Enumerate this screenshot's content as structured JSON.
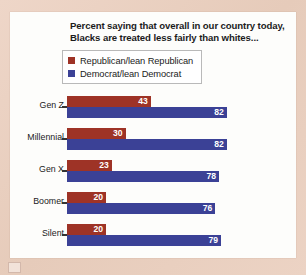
{
  "chart_data": {
    "type": "bar",
    "orientation": "horizontal",
    "title": "Percent saying that overall in our country today, Blacks are treated less fairly than whites...",
    "title_lines": [
      "Percent saying that overall in our country today,",
      "Blacks are treated less fairly than whites..."
    ],
    "categories": [
      "Gen Z",
      "Millennial",
      "Gen X",
      "Boomer",
      "Silent"
    ],
    "series": [
      {
        "name": "Republican/lean Republican",
        "color": "#9e3326",
        "values": [
          43,
          30,
          23,
          20,
          20
        ]
      },
      {
        "name": "Democrat/lean Democrat",
        "color": "#3b4196",
        "values": [
          82,
          82,
          78,
          76,
          79
        ]
      }
    ],
    "xlabel": "",
    "ylabel": "",
    "xlim": [
      0,
      100
    ],
    "grid": false,
    "legend_position": "top-left",
    "value_labels": true
  },
  "legend": {
    "items": [
      {
        "label": "Republican/lean Republican",
        "color": "#9e3326"
      },
      {
        "label": "Democrat/lean Democrat",
        "color": "#3b4196"
      }
    ]
  },
  "colors": {
    "republican": "#9e3326",
    "democrat": "#3b4196",
    "card": "#fdfdfb",
    "backdrop": "#e9d0c1",
    "text": "#1b1b1b",
    "value_text": "#ffffff"
  }
}
